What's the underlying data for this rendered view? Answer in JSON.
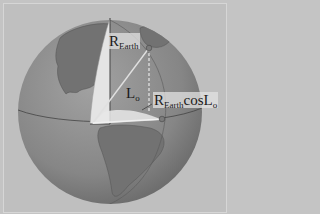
{
  "diagram": {
    "labels": {
      "radius_main": "R",
      "radius_sub": "Earth",
      "angle_main": "L",
      "angle_sub": "o",
      "projected_main": "R",
      "projected_sub": "Earth",
      "projected_func": "cos",
      "projected_angle_main": "L",
      "projected_angle_sub": "o"
    },
    "colors": {
      "background": "#bfbfbf",
      "ocean": "#8a8a8a",
      "land": "#6e6e6e",
      "plane": "#e6e6e6",
      "lines": "#d8d8d8"
    }
  }
}
